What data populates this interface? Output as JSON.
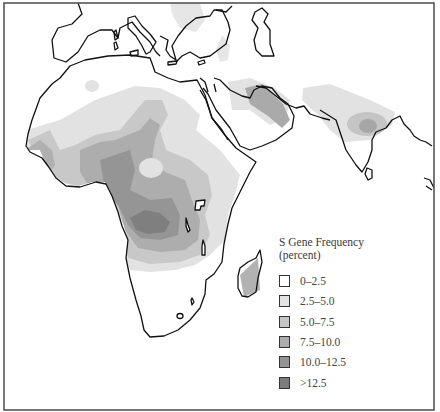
{
  "map": {
    "title": "S Gene Frequency",
    "subtitle": "(percent)",
    "region": "Africa, Mediterranean, Middle East, India",
    "frame": {
      "x": 4,
      "y": 3,
      "width": 430,
      "height": 407
    }
  },
  "legend": {
    "title": "S Gene Frequency",
    "unit": "(percent)",
    "items": [
      {
        "label": "0–2.5",
        "color": "#ffffff"
      },
      {
        "label": "2.5–5.0",
        "color": "#e3e3e3"
      },
      {
        "label": "5.0–7.5",
        "color": "#c6c6c6"
      },
      {
        "label": "7.5–10.0",
        "color": "#adadad"
      },
      {
        "label": "10.0–12.5",
        "color": "#949494"
      },
      {
        "label": ">12.5",
        "color": "#7d7d7d"
      }
    ]
  },
  "colors": {
    "coastline": "#111111",
    "frame": "#555555",
    "background": "#ffffff"
  }
}
